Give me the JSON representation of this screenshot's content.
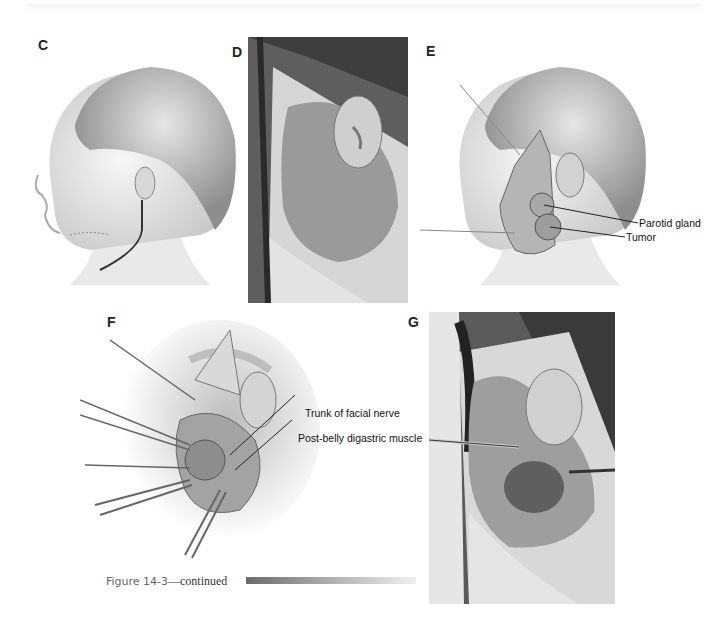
{
  "header": {
    "rule": "top-gray-rule"
  },
  "panels": [
    {
      "id": "C",
      "label": "C",
      "type": "illustration",
      "description": "Child head profile with incision line along jaw and behind ear"
    },
    {
      "id": "D",
      "label": "D",
      "type": "photo",
      "description": "Intraoperative photo, skin flap raised around ear"
    },
    {
      "id": "E",
      "label": "E",
      "type": "illustration",
      "description": "Child head profile with parotid region exposed",
      "callouts": [
        {
          "text": "Parotid gland"
        },
        {
          "text": "Tumor"
        }
      ]
    },
    {
      "id": "F",
      "label": "F",
      "type": "illustration",
      "description": "Surgical field with retractors and hooks",
      "callouts": [
        {
          "text": "Trunk of facial nerve"
        },
        {
          "text": "Post-belly digastric muscle"
        }
      ]
    },
    {
      "id": "G",
      "label": "G",
      "type": "photo",
      "description": "Intraoperative photo with instruments, tumor exposed"
    }
  ],
  "caption": {
    "figure": "Figure 14-3",
    "suffix": "—continued"
  }
}
